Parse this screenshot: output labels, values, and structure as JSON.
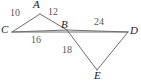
{
  "figure": {
    "type": "geometry-diagram",
    "background_color": "#ffffff",
    "stroke_color": "#6e6e70",
    "vertex_label_color": "#1a1a1a",
    "edge_label_color": "#58585a"
  },
  "vertices": [
    {
      "id": "A",
      "label": "A",
      "x": 40,
      "y": 14,
      "label_x": 33,
      "label_y": -1
    },
    {
      "id": "C",
      "label": "C",
      "x": 12,
      "y": 32,
      "label_x": 1,
      "label_y": 24
    },
    {
      "id": "B",
      "label": "B",
      "x": 67,
      "y": 30,
      "label_x": 61,
      "label_y": 19
    },
    {
      "id": "D",
      "label": "D",
      "x": 128,
      "y": 32,
      "label_x": 130,
      "label_y": 25
    },
    {
      "id": "E",
      "label": "E",
      "x": 97,
      "y": 70,
      "label_x": 94,
      "label_y": 70
    }
  ],
  "edges": [
    {
      "id": "CA",
      "from": "C",
      "to": "A",
      "length_label": "10",
      "label_x": 10,
      "label_y": 8
    },
    {
      "id": "AB",
      "from": "A",
      "to": "B",
      "length_label": "12",
      "label_x": 48,
      "label_y": 7
    },
    {
      "id": "CD",
      "from": "C",
      "to": "D",
      "length_label": null,
      "label_x": null,
      "label_y": null
    },
    {
      "id": "CB",
      "from": "C",
      "to": "B",
      "length_label": "16",
      "label_x": 31,
      "label_y": 35
    },
    {
      "id": "BD",
      "from": "B",
      "to": "D",
      "length_label": "24",
      "label_x": 94,
      "label_y": 17
    },
    {
      "id": "BE",
      "from": "B",
      "to": "E",
      "length_label": "18",
      "label_x": 62,
      "label_y": 45
    },
    {
      "id": "ED",
      "from": "E",
      "to": "D",
      "length_label": null,
      "label_x": null,
      "label_y": null
    }
  ],
  "edge_labels": [
    {
      "id": "label-10",
      "text": "10",
      "x": 10,
      "y": 8
    },
    {
      "id": "label-12",
      "text": "12",
      "x": 48,
      "y": 7
    },
    {
      "id": "label-16",
      "text": "16",
      "x": 31,
      "y": 35
    },
    {
      "id": "label-24",
      "text": "24",
      "x": 94,
      "y": 17
    },
    {
      "id": "label-18",
      "text": "18",
      "x": 62,
      "y": 45
    }
  ]
}
